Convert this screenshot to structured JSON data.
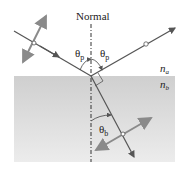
{
  "diagram": {
    "title_label": "Normal",
    "angles": {
      "incident": "θp",
      "incident_main": "θ",
      "incident_sub": "p",
      "reflected_main": "θ",
      "reflected_sub": "p",
      "refracted_main": "θ",
      "refracted_sub": "b"
    },
    "media": {
      "upper": {
        "main": "n",
        "sub": "a"
      },
      "lower": {
        "main": "n",
        "sub": "b"
      }
    },
    "colors": {
      "medium_b_fill": "#d8d8d8",
      "ray": "#555555",
      "polarization_arrow": "#888888",
      "normal_line": "#333333"
    }
  }
}
